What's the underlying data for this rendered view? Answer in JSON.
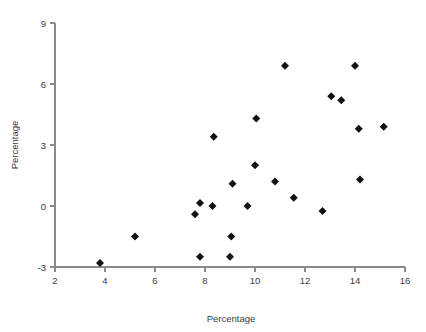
{
  "chart_data": {
    "type": "scatter",
    "title": "",
    "xlabel": "Percentage",
    "ylabel": "Percentage",
    "xlim": [
      2,
      16
    ],
    "ylim": [
      -3,
      9
    ],
    "xticks": [
      2,
      4,
      6,
      8,
      10,
      12,
      14,
      16
    ],
    "yticks": [
      -3,
      0,
      3,
      6,
      9
    ],
    "xtick_labels": [
      "2",
      "4",
      "6",
      "8",
      "10",
      "12",
      "14",
      "16"
    ],
    "ytick_labels": [
      "-3",
      "0",
      "3",
      "6",
      "9"
    ],
    "grid": false,
    "legend": false,
    "marker": "diamond",
    "marker_color": "#111111",
    "points": [
      {
        "x": 3.8,
        "y": -2.8
      },
      {
        "x": 5.2,
        "y": -1.5
      },
      {
        "x": 7.6,
        "y": -0.4
      },
      {
        "x": 7.8,
        "y": 0.15
      },
      {
        "x": 7.8,
        "y": -2.5
      },
      {
        "x": 8.3,
        "y": 0.0
      },
      {
        "x": 8.35,
        "y": 3.4
      },
      {
        "x": 9.0,
        "y": -2.5
      },
      {
        "x": 9.05,
        "y": -1.5
      },
      {
        "x": 9.1,
        "y": 1.1
      },
      {
        "x": 9.7,
        "y": 0.0
      },
      {
        "x": 10.0,
        "y": 2.0
      },
      {
        "x": 10.05,
        "y": 4.3
      },
      {
        "x": 10.8,
        "y": 1.2
      },
      {
        "x": 11.2,
        "y": 6.9
      },
      {
        "x": 11.55,
        "y": 0.4
      },
      {
        "x": 12.7,
        "y": -0.25
      },
      {
        "x": 13.05,
        "y": 5.4
      },
      {
        "x": 13.45,
        "y": 5.2
      },
      {
        "x": 14.0,
        "y": 6.9
      },
      {
        "x": 14.15,
        "y": 3.8
      },
      {
        "x": 14.2,
        "y": 1.3
      },
      {
        "x": 15.15,
        "y": 3.9
      }
    ]
  },
  "axes": {
    "x_title": "Percentage",
    "y_title": "Percentage"
  },
  "colors": {
    "axis": "#8a8a8a",
    "text": "#3a3a3a",
    "marker": "#111111",
    "background": "#ffffff"
  }
}
